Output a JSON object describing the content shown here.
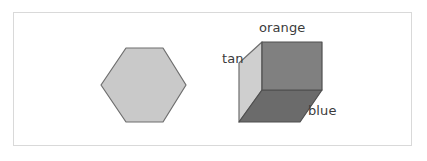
{
  "figure": {
    "background_color": "#ffffff",
    "border_color": "#d9d9d9",
    "width": 427,
    "height": 161
  },
  "shapes": [
    {
      "name": "hexagon",
      "type": "hexagon",
      "orientation": "flat-top",
      "fill_color": "#c9c9c9",
      "stroke_color": "#6e6e6e",
      "label": "",
      "points": "126,48 163,48 186,85 163,122 126,122 101,85"
    },
    {
      "name": "box",
      "type": "rectangular-prism",
      "faces": [
        {
          "face": "front",
          "label": "orange",
          "fill_color": "#808080",
          "stroke_color": "#4f4f4f",
          "points": "262,42 322,42 322,90 262,90"
        },
        {
          "face": "left",
          "label": "tan",
          "fill_color": "#cfcfcf",
          "stroke_color": "#6e6e6e",
          "points": "262,42 262,90 239,122 239,63"
        },
        {
          "face": "bottom",
          "label": "blue",
          "fill_color": "#6b6b6b",
          "stroke_color": "#4f4f4f",
          "points": "262,90 322,90 300,122 239,122"
        }
      ]
    }
  ],
  "labels": {
    "orange": "orange",
    "tan": "tan",
    "blue": "blue",
    "text_color": "#3b3b3b"
  }
}
